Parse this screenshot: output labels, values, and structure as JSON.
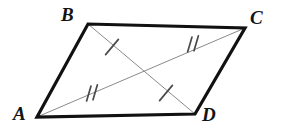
{
  "figure": {
    "canvas": {
      "width": 283,
      "height": 138,
      "background": "#ffffff"
    },
    "colors": {
      "outline": "#111111",
      "diagonal": "#8a8a8a",
      "tick": "#4a4a4a",
      "label": "#141414"
    },
    "stroke_widths": {
      "outline": 3.2,
      "diagonal": 1.0,
      "tick": 1.6
    },
    "vertices": [
      {
        "name": "A",
        "label": "A",
        "x": 37,
        "y": 117
      },
      {
        "name": "B",
        "label": "B",
        "x": 88,
        "y": 24
      },
      {
        "name": "C",
        "label": "C",
        "x": 245,
        "y": 28
      },
      {
        "name": "D",
        "label": "D",
        "x": 195,
        "y": 114
      }
    ],
    "outline_path": "M 37 117 L 88 24 L 245 28 L 195 114 Z",
    "sides": [
      {
        "name": "AB",
        "from": "A",
        "to": "B"
      },
      {
        "name": "BC",
        "from": "B",
        "to": "C"
      },
      {
        "name": "CD",
        "from": "C",
        "to": "D"
      },
      {
        "name": "DA",
        "from": "D",
        "to": "A"
      }
    ],
    "diagonals": [
      {
        "name": "AC",
        "from": "A",
        "to": "C",
        "x1": 37,
        "y1": 117,
        "x2": 245,
        "y2": 28
      },
      {
        "name": "BD",
        "from": "B",
        "to": "D",
        "x1": 88,
        "y1": 24,
        "x2": 195,
        "y2": 114
      }
    ],
    "tick_marks": [
      {
        "name": "tick-bd-near-b",
        "on": "BD",
        "count": 1,
        "cx": 112,
        "cy": 47
      },
      {
        "name": "tick-bd-near-d",
        "on": "BD",
        "count": 1,
        "cx": 166,
        "cy": 93
      },
      {
        "name": "tick-ac-near-a",
        "on": "AC",
        "count": 2,
        "cx": 92,
        "cy": 94
      },
      {
        "name": "tick-ac-near-c",
        "on": "AC",
        "count": 2,
        "cx": 193,
        "cy": 45
      }
    ]
  }
}
